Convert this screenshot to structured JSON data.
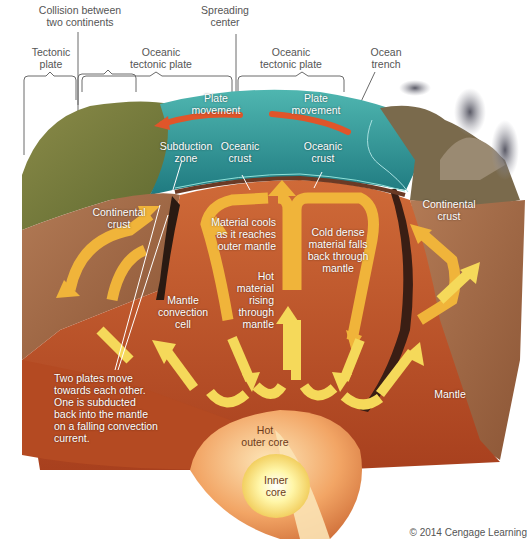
{
  "diagram": {
    "colors": {
      "ocean": "#2f9a9a",
      "ocean_dark": "#1c6f78",
      "land": "#7d7a3c",
      "continental_crust": "#a86a45",
      "mantle": "#c2532a",
      "mantle_dark": "#9c3a1b",
      "arrow": "#f0b43a",
      "arrow_light": "#f5d95a",
      "plate_arrow": "#e0552a",
      "outer_core": "#f0a060",
      "inner_core": "#fff3a0",
      "smoke": "#6d6d78",
      "label_dark": "#555555",
      "label_light": "#ffffff"
    }
  },
  "labels": {
    "collision": "Collision between\ntwo continents",
    "spreading_center": "Spreading\ncenter",
    "tectonic_plate": "Tectonic\nplate",
    "oceanic_plate_left": "Oceanic\ntectonic plate",
    "oceanic_plate_right": "Oceanic\ntectonic plate",
    "ocean_trench": "Ocean\ntrench",
    "plate_movement_left": "Plate\nmovement",
    "plate_movement_right": "Plate\nmovement",
    "subduction_zone": "Subduction\nzone",
    "oceanic_crust_left": "Oceanic\ncrust",
    "oceanic_crust_right": "Oceanic\ncrust",
    "continental_crust_left": "Continental\ncrust",
    "continental_crust_right": "Continental\ncrust",
    "material_cools": "Material cools\nas it reaches\nouter mantle",
    "cold_dense": "Cold dense\nmaterial falls\nback through\nmantle",
    "hot_material": "Hot\nmaterial\nrising\nthrough\nmantle",
    "mantle_convection_cell": "Mantle\nconvection\ncell",
    "two_plates": "Two plates move\ntowards each other.\nOne is subducted\nback into the mantle\non a falling convection\ncurrent.",
    "mantle": "Mantle",
    "hot_outer_core": "Hot\nouter core",
    "inner_core": "Inner\ncore"
  },
  "footer": {
    "copyright": "© 2014 Cengage Learning"
  }
}
